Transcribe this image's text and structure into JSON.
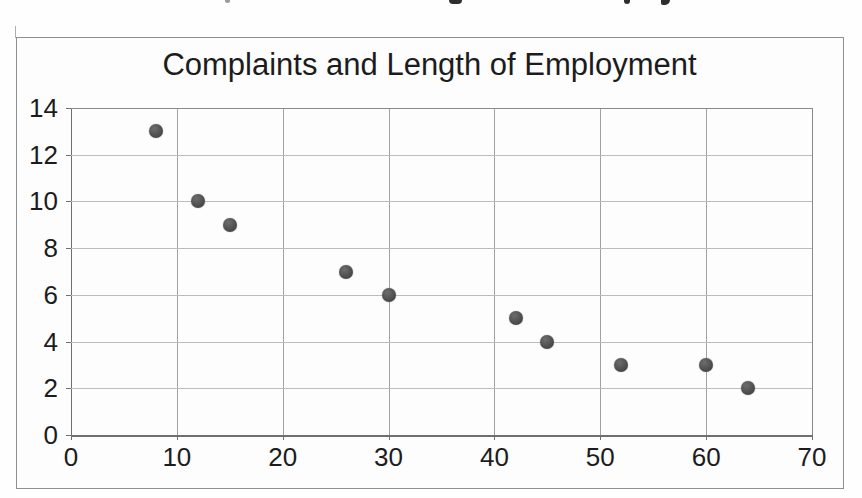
{
  "chart_data": {
    "type": "scatter",
    "title": "Complaints and Length of Employment",
    "xlabel": "",
    "ylabel": "",
    "xlim": [
      0,
      70
    ],
    "ylim": [
      0,
      14
    ],
    "x_ticks": [
      0,
      10,
      20,
      30,
      40,
      50,
      60,
      70
    ],
    "y_ticks": [
      0,
      2,
      4,
      6,
      8,
      10,
      12,
      14
    ],
    "grid": true,
    "legend": false,
    "series": [
      {
        "name": "complaints-vs-length-of-employment",
        "points": [
          [
            8,
            13
          ],
          [
            12,
            10
          ],
          [
            15,
            9
          ],
          [
            26,
            7
          ],
          [
            30,
            6
          ],
          [
            42,
            5
          ],
          [
            45,
            4
          ],
          [
            52,
            3
          ],
          [
            60,
            3
          ],
          [
            64,
            2
          ]
        ]
      }
    ]
  },
  "colors": {
    "marker": "#4a4a4a",
    "grid_inner": "#b4b4b4",
    "frame": "#8a8a8a",
    "axis": "#6f6f6f",
    "text": "#1c1c1c",
    "paper": "#fdfdfd"
  }
}
